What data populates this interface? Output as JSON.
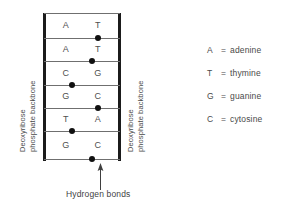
{
  "diagram": {
    "backbone_caption": {
      "line1": "Deoxyribose",
      "line2": "phosphate backbone"
    },
    "hydrogen_bonds_label": "Hydrogen bonds",
    "arrow_icon": "up-arrow-icon",
    "colors": {
      "backbone": "#1b1b1b",
      "rung": "#6f6f6f",
      "dot": "#101010",
      "text": "#4a4a4a",
      "background": "#ffffff"
    },
    "base_pairs": [
      {
        "left": "A",
        "right": "T"
      },
      {
        "left": "A",
        "right": "T"
      },
      {
        "left": "C",
        "right": "G"
      },
      {
        "left": "G",
        "right": "C"
      },
      {
        "left": "T",
        "right": "A"
      },
      {
        "left": "G",
        "right": "C"
      }
    ],
    "rungs": [
      {
        "y": 0,
        "dot_x": null
      },
      {
        "y": 25,
        "dot_x": 55
      },
      {
        "y": 48,
        "dot_x": 49
      },
      {
        "y": 72,
        "dot_x": 29
      },
      {
        "y": 95,
        "dot_x": 55
      },
      {
        "y": 118,
        "dot_x": 29
      },
      {
        "y": 146,
        "dot_x": 49
      }
    ]
  },
  "legend": {
    "equals": "=",
    "entries": [
      {
        "symbol": "A",
        "name": "adenine"
      },
      {
        "symbol": "T",
        "name": "thymine"
      },
      {
        "symbol": "G",
        "name": "guanine"
      },
      {
        "symbol": "C",
        "name": "cytosine"
      }
    ]
  }
}
